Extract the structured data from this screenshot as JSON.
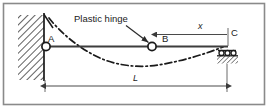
{
  "figure": {
    "type": "structural-beam-diagram",
    "frame": {
      "border_color": "#8a8a8a",
      "background": "#ffffff"
    },
    "colors": {
      "line": "#1a1a1a",
      "beam": "#3d3d3d",
      "hatch": "#2b2b2b",
      "dim": "#4a4a4a",
      "text": "#1a1a1a"
    },
    "labels": {
      "plastic_hinge": "Plastic hinge",
      "point_a": "A",
      "point_b": "B",
      "point_c": "C",
      "dim_x": "x",
      "dim_l": "L"
    },
    "elements": {
      "left_support": "fixed-wall-with-pin",
      "right_support": "roller",
      "hinge_b": "plastic-hinge-circle",
      "deflected_shape": "dash-dot-curve"
    }
  }
}
